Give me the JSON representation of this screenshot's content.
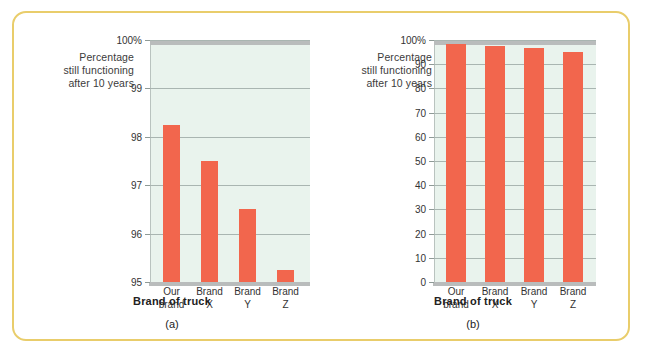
{
  "figure": {
    "border_color": "#e9cd6b",
    "bar_color": "#f2664d",
    "plot_bg": "#e9f3ed",
    "grid_color": "#a9b5b1"
  },
  "panel_a": {
    "caption": "(a)",
    "y_axis_title": "Percentage still functioning after 10 years",
    "y_axis_title_line1": "Percentage",
    "y_axis_title_line2": "still functioning",
    "y_axis_title_line3": "after 10 years",
    "x_axis_title": "Brand of truck"
  },
  "panel_b": {
    "caption": "(b)",
    "y_axis_title_line1": "Percentage",
    "y_axis_title_line2": "still functioning",
    "y_axis_title_line3": "after 10 years",
    "x_axis_title": "Brand of truck"
  },
  "chart_data": [
    {
      "type": "bar",
      "id": "a",
      "title": "",
      "caption": "(a)",
      "categories": [
        "Our brand",
        "Brand X",
        "Brand Y",
        "Brand Z"
      ],
      "category_lines": [
        [
          "Our",
          "brand"
        ],
        [
          "Brand",
          "X"
        ],
        [
          "Brand",
          "Y"
        ],
        [
          "Brand",
          "Z"
        ]
      ],
      "values": [
        98.25,
        97.5,
        96.5,
        95.25
      ],
      "xlabel": "Brand of truck",
      "ylabel": "Percentage still functioning after 10 years",
      "ylim": [
        95,
        100
      ],
      "yticks": [
        95,
        96,
        97,
        98,
        99,
        100
      ],
      "ytick_labels": [
        "95",
        "96",
        "97",
        "98",
        "99",
        "100%"
      ],
      "grid": true,
      "legend": "none",
      "note": "truncated y-axis exaggerates differences"
    },
    {
      "type": "bar",
      "id": "b",
      "title": "",
      "caption": "(b)",
      "categories": [
        "Our brand",
        "Brand X",
        "Brand Y",
        "Brand Z"
      ],
      "category_lines": [
        [
          "Our",
          "brand"
        ],
        [
          "Brand",
          "X"
        ],
        [
          "Brand",
          "Y"
        ],
        [
          "Brand",
          "Z"
        ]
      ],
      "values": [
        98.25,
        97.5,
        96.5,
        95.25
      ],
      "xlabel": "Brand of truck",
      "ylabel": "Percentage still functioning after 10 years",
      "ylim": [
        0,
        100
      ],
      "yticks": [
        0,
        10,
        20,
        30,
        40,
        50,
        60,
        70,
        80,
        90,
        100
      ],
      "ytick_labels": [
        "0",
        "10",
        "20",
        "30",
        "40",
        "50",
        "60",
        "70",
        "80",
        "90",
        "100%"
      ],
      "grid": true,
      "legend": "none",
      "note": "full y-axis shows differences are small"
    }
  ]
}
